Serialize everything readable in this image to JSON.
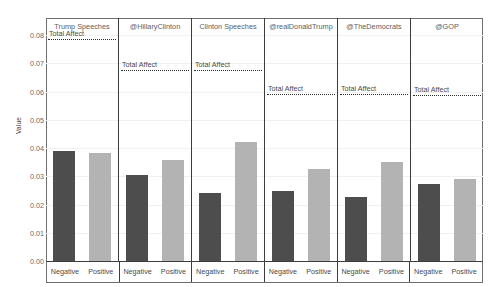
{
  "chart_data": {
    "type": "bar",
    "title": "",
    "xlabel": "",
    "ylabel": "Value",
    "ylim": [
      0.0,
      0.08
    ],
    "ytick_labels": [
      "0.08",
      "0.07",
      "0.06",
      "0.05",
      "0.04",
      "0.03",
      "0.02",
      "0.01",
      "0.00"
    ],
    "ytick_values": [
      0.08,
      0.07,
      0.06,
      0.05,
      0.04,
      0.03,
      0.02,
      0.01,
      0.0
    ],
    "grid": false,
    "legend": "none",
    "categories": [
      "Negative",
      "Positive"
    ],
    "category_colors": {
      "Negative": "#4d4d4d",
      "Positive": "#b3b3b3"
    },
    "reference_line_label": "Total Affect",
    "reference_line_style": "dotted",
    "panels": [
      {
        "name": "Trump Speeches",
        "values": [
          0.039,
          0.0383
        ],
        "total_affect": 0.0785
      },
      {
        "name": "@HillaryClinton",
        "values": [
          0.0303,
          0.0358
        ],
        "total_affect": 0.0676
      },
      {
        "name": "Clinton Speeches",
        "values": [
          0.0241,
          0.042
        ],
        "total_affect": 0.0676
      },
      {
        "name": "@realDonaldTrump",
        "values": [
          0.0248,
          0.0326
        ],
        "total_affect": 0.0592
      },
      {
        "name": "@TheDemocrats",
        "values": [
          0.0226,
          0.0351
        ],
        "total_affect": 0.059
      },
      {
        "name": "@GOP",
        "values": [
          0.0272,
          0.029
        ],
        "total_affect": 0.0588
      }
    ]
  }
}
